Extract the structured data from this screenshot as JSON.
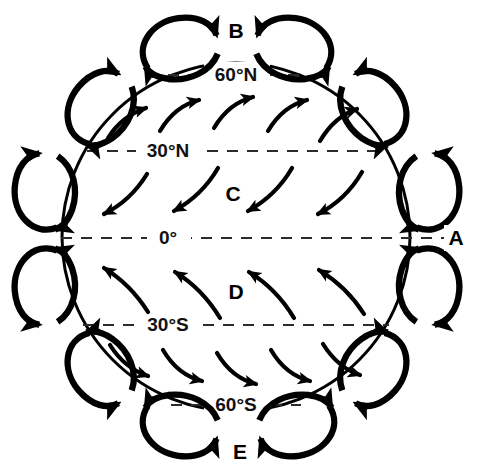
{
  "figure": {
    "background_color": "#ffffff",
    "ink_color": "#000000",
    "globe": {
      "center_x": 236,
      "center_y": 237,
      "radius": 174
    }
  },
  "latitude_lines": [
    {
      "id": "lat-60n",
      "label": "60°N",
      "y": 75,
      "label_x": 236,
      "dashed": true
    },
    {
      "id": "lat-30n",
      "label": "30°N",
      "y": 151,
      "label_x": 168,
      "dashed": true
    },
    {
      "id": "lat-0",
      "label": "0°",
      "y": 238,
      "label_x": 168,
      "dashed": true
    },
    {
      "id": "lat-30s",
      "label": "30°S",
      "y": 325,
      "label_x": 168,
      "dashed": true
    },
    {
      "id": "lat-60s",
      "label": "60°S",
      "y": 405,
      "label_x": 236,
      "dashed": true
    }
  ],
  "zone_labels": [
    {
      "id": "label-a",
      "text": "A",
      "x": 456,
      "y": 238
    },
    {
      "id": "label-b",
      "text": "B",
      "x": 236,
      "y": 31
    },
    {
      "id": "label-c",
      "text": "C",
      "x": 233,
      "y": 194
    },
    {
      "id": "label-d",
      "text": "D",
      "x": 236,
      "y": 292
    },
    {
      "id": "label-e",
      "text": "E",
      "x": 240,
      "y": 452
    }
  ],
  "circulation_cells": [
    {
      "id": "cell-polar-n-left",
      "angle_deg": 252,
      "hemisphere": "north",
      "band": "polar"
    },
    {
      "id": "cell-polar-n-right",
      "angle_deg": 288,
      "hemisphere": "north",
      "band": "polar"
    },
    {
      "id": "cell-ferrel-n-left",
      "angle_deg": 216,
      "hemisphere": "north",
      "band": "ferrel"
    },
    {
      "id": "cell-ferrel-n-right",
      "angle_deg": 324,
      "hemisphere": "north",
      "band": "ferrel"
    },
    {
      "id": "cell-hadley-n-left",
      "angle_deg": 180,
      "hemisphere": "north",
      "band": "hadley"
    },
    {
      "id": "cell-hadley-n-right",
      "angle_deg": 0,
      "hemisphere": "north",
      "band": "hadley"
    },
    {
      "id": "cell-hadley-s-left",
      "angle_deg": 144,
      "hemisphere": "south",
      "band": "hadley"
    },
    {
      "id": "cell-hadley-s-right",
      "angle_deg": 36,
      "hemisphere": "south",
      "band": "hadley"
    },
    {
      "id": "cell-ferrel-s-left",
      "angle_deg": 108,
      "hemisphere": "south",
      "band": "ferrel"
    },
    {
      "id": "cell-ferrel-s-right",
      "angle_deg": 72,
      "hemisphere": "south",
      "band": "ferrel"
    },
    {
      "id": "cell-polar-s-left",
      "angle_deg": 252,
      "hemisphere": "south",
      "band": "polar"
    },
    {
      "id": "cell-polar-s-right",
      "angle_deg": 288,
      "hemisphere": "south",
      "band": "polar"
    }
  ],
  "surface_wind_bands": [
    {
      "id": "band-westerlies-n",
      "between": "30°N - 60°N",
      "direction": "up-right",
      "arrow_count": 5
    },
    {
      "id": "band-trades-ne",
      "between": "0° - 30°N",
      "direction": "down-left",
      "arrow_count": 4
    },
    {
      "id": "band-trades-se",
      "between": "30°S - 0°",
      "direction": "up-left",
      "arrow_count": 4
    },
    {
      "id": "band-westerlies-s",
      "between": "60°S - 30°S",
      "direction": "down-right",
      "arrow_count": 5
    }
  ]
}
